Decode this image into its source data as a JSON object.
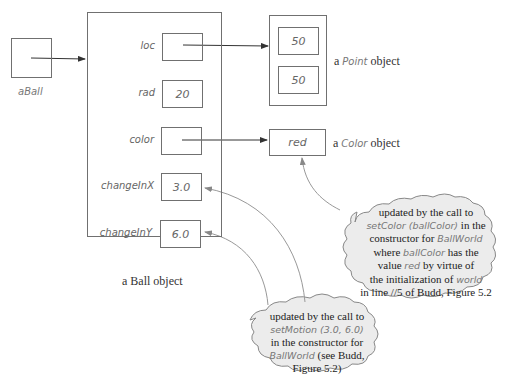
{
  "variable": {
    "name": "aBall"
  },
  "ball_object": {
    "caption": "a Ball object",
    "fields": [
      {
        "name": "loc",
        "value": ""
      },
      {
        "name": "rad",
        "value": "20"
      },
      {
        "name": "color",
        "value": ""
      },
      {
        "name": "changeInX",
        "value": "3.0"
      },
      {
        "name": "changeInY",
        "value": "6.0"
      }
    ]
  },
  "point_object": {
    "caption_prefix": "a",
    "caption_type": "Point",
    "caption_suffix": "object",
    "values": [
      "50",
      "50"
    ]
  },
  "color_object": {
    "caption_prefix": "a",
    "caption_type": "Color",
    "caption_suffix": "object",
    "value": "red"
  },
  "annotations": {
    "color_note": {
      "lines": [
        [
          "updated by the call to"
        ],
        [
          "setColor (ballColor)",
          " in the"
        ],
        [
          "constructor for ",
          "BallWorld"
        ],
        [
          "where ",
          "ballColor",
          " has the"
        ],
        [
          "value ",
          "red",
          " by virtue of"
        ],
        [
          "the initialization of ",
          "world"
        ],
        [
          "in line //5 of Budd, Figure 5.2"
        ]
      ]
    },
    "motion_note": {
      "lines": [
        [
          "updated by the call to"
        ],
        [
          "setMotion (3.0, 6.0)"
        ],
        [
          "in the constructor for"
        ],
        [
          "BallWorld",
          " (see Budd,"
        ],
        [
          "Figure 5.2)"
        ]
      ]
    }
  },
  "colors": {
    "stroke": "#707070",
    "text": "#666666",
    "caption": "#333333"
  }
}
